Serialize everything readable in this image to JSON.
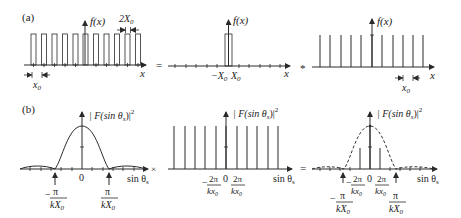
{
  "figure": {
    "part_a_label": "(a)",
    "part_b_label": "(b)",
    "operators": {
      "equals": "=",
      "convolve": "*",
      "times": "×"
    },
    "row_a": {
      "panel1": {
        "ylabel": "f(x)",
        "xlabel": "x",
        "pulse_width_label": "2X",
        "pulse_width_sub": "0",
        "period_label": "x",
        "period_sub": "0",
        "pulse_count": 11
      },
      "panel2": {
        "ylabel": "f(x)",
        "xlabel": "x",
        "left_label": "−X",
        "left_sub": "0",
        "right_label": "X",
        "right_sub": "0"
      },
      "panel3": {
        "ylabel": "f(x)",
        "xlabel": "x",
        "period_label": "x",
        "period_sub": "0",
        "impulse_count": 11
      }
    },
    "row_b": {
      "panel1": {
        "ylabel": "| F(sin θ",
        "ylabel_sub": "s",
        "ylabel_end": ")|",
        "ylabel_sup": "2",
        "xlabel": "sin θ",
        "xlabel_sub": "s",
        "zero": "0",
        "neg_num": "π",
        "neg_den": "kX",
        "neg_den_sub": "0",
        "pos_num": "π",
        "pos_den": "kX",
        "pos_den_sub": "0",
        "minus": "−"
      },
      "panel2": {
        "ylabel": "| F(sin θ",
        "ylabel_sub": "s",
        "ylabel_end": ")|",
        "ylabel_sup": "2",
        "xlabel": "sin θ",
        "xlabel_sub": "s",
        "zero": "0",
        "num": "2π",
        "den": "kx",
        "den_sub": "0",
        "minus": "−",
        "impulse_count": 11
      },
      "panel3": {
        "ylabel": "| F(sin θ",
        "ylabel_sub": "s",
        "ylabel_end": ")|",
        "ylabel_sup": "2",
        "xlabel": "sin θ",
        "xlabel_sub": "s",
        "zero": "0",
        "num2": "2π",
        "den2": "kx",
        "den2_sub": "0",
        "num1": "π",
        "den1": "kX",
        "den1_sub": "0",
        "minus": "−"
      }
    }
  }
}
